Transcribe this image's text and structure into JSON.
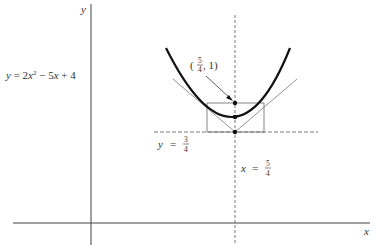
{
  "figure": {
    "equation_label": "y = 2x² − 5x + 4",
    "eq": {
      "y": "y",
      "eq": " = 2",
      "x1": "x",
      "sq": "2",
      "mid": " − 5",
      "x2": "x",
      "tail": " + 4"
    },
    "axes": {
      "x_label": "x",
      "y_label": "y"
    },
    "point_label": {
      "open": "(",
      "num": "5",
      "den": "4",
      "rest": ", 1)"
    },
    "directrix_label": {
      "var": "y",
      "eq": "=",
      "num": "3",
      "den": "4"
    },
    "axis_of_symmetry_label": {
      "var": "x",
      "eq": "=",
      "num": "5",
      "den": "4"
    },
    "colors": {
      "curve": "#111111",
      "lines": "#555555",
      "axes": "#444444"
    }
  }
}
